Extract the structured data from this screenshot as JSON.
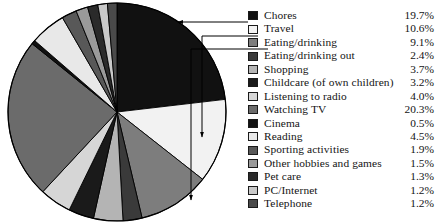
{
  "chart_data": {
    "type": "pie",
    "title": "",
    "subtitle": "",
    "xlabel": "",
    "ylabel": "",
    "unit": "%",
    "start_angle_deg": 0,
    "direction": "clockwise",
    "legend_position": "right",
    "grid": false,
    "categories": [
      "Chores",
      "Travel",
      "Eating/drinking",
      "Eating/drinking out",
      "Shopping",
      "Childcare (of own children)",
      "Listening to radio",
      "Watching TV",
      "Cinema",
      "Reading",
      "Sporting activities",
      "Other hobbies and games",
      "Pet care",
      "PC/Internet",
      "Telephone"
    ],
    "values": [
      19.7,
      10.6,
      9.1,
      2.4,
      3.7,
      3.2,
      4.0,
      20.3,
      0.5,
      4.5,
      1.9,
      1.5,
      1.3,
      1.2,
      1.2
    ],
    "value_labels": [
      "19.7%",
      "10.6%",
      "9.1%",
      "2.4%",
      "3.7%",
      "3.2%",
      "4.0%",
      "20.3%",
      "0.5%",
      "4.5%",
      "1.9%",
      "1.5%",
      "1.3%",
      "1.2%",
      "1.2%"
    ],
    "colors": [
      "#111111",
      "#f2f2f2",
      "#7d7d7d",
      "#3a3a3a",
      "#b4b4b4",
      "#1a1a1a",
      "#d6d6d6",
      "#6b6b6b",
      "#111111",
      "#e8e8e8",
      "#585858",
      "#9a9a9a",
      "#2a2a2a",
      "#c9c9c9",
      "#4a4a4a"
    ]
  },
  "legend": {
    "rows": [
      {
        "label": "Chores",
        "value": "19.7%",
        "color": "#111111"
      },
      {
        "label": "Travel",
        "value": "10.6%",
        "color": "#f2f2f2"
      },
      {
        "label": "Eating/drinking",
        "value": "9.1%",
        "color": "#7d7d7d"
      },
      {
        "label": "Eating/drinking out",
        "value": "2.4%",
        "color": "#3a3a3a"
      },
      {
        "label": "Shopping",
        "value": "3.7%",
        "color": "#b4b4b4"
      },
      {
        "label": "Childcare (of own children)",
        "value": "3.2%",
        "color": "#1a1a1a"
      },
      {
        "label": "Listening to radio",
        "value": "4.0%",
        "color": "#d6d6d6"
      },
      {
        "label": "Watching TV",
        "value": "20.3%",
        "color": "#6b6b6b"
      },
      {
        "label": "Cinema",
        "value": "0.5%",
        "color": "#111111"
      },
      {
        "label": "Reading",
        "value": "4.5%",
        "color": "#e8e8e8"
      },
      {
        "label": "Sporting activities",
        "value": "1.9%",
        "color": "#585858"
      },
      {
        "label": "Other hobbies and games",
        "value": "1.5%",
        "color": "#9a9a9a"
      },
      {
        "label": "Pet care",
        "value": "1.3%",
        "color": "#2a2a2a"
      },
      {
        "label": "PC/Internet",
        "value": "1.2%",
        "color": "#c9c9c9"
      },
      {
        "label": "Telephone",
        "value": "1.2%",
        "color": "#4a4a4a"
      }
    ]
  },
  "pie": {
    "center_x": 117,
    "center_y": 112,
    "radius": 109,
    "outline_color": "#000000"
  },
  "leaders": [
    {
      "target": "Chores",
      "to_x": 8,
      "to_y": 22,
      "elbow_x": 88,
      "elbow_y": 22
    },
    {
      "target": "Travel",
      "to_x": 32,
      "to_y": 137,
      "elbow_x": 98,
      "elbow_y": 36
    },
    {
      "target": "Eating/drinking",
      "to_x": 21,
      "to_y": 200,
      "elbow_x": 108,
      "elbow_y": 49
    }
  ]
}
